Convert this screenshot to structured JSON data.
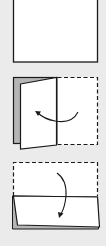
{
  "diagram": {
    "title": "",
    "steps": [
      {
        "step": 1,
        "description": "square-sheet"
      },
      {
        "step": 2,
        "description": "fold-left-flap-over",
        "arrow": "left"
      },
      {
        "step": 3,
        "description": "fold-top-half-down",
        "arrow": "down"
      }
    ],
    "colors": {
      "background": "#ebebeb",
      "paper": "#ffffff",
      "shadow": "#b5b5b5",
      "line": "#1a1a1a"
    }
  }
}
